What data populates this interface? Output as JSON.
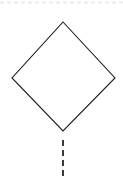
{
  "canvas": {
    "width": 123,
    "height": 179,
    "background_color": "#ffffff"
  },
  "diagram": {
    "type": "flowchart-fragment",
    "title": "",
    "shapes": [
      {
        "id": "decision-diamond",
        "kind": "diamond",
        "label": "",
        "fill_color": "#ffffff",
        "stroke_color": "#1a1a1a",
        "stroke_width": 1,
        "vertices": {
          "top": {
            "x": 63,
            "y": 22
          },
          "right": {
            "x": 115,
            "y": 78
          },
          "bottom": {
            "x": 63,
            "y": 131
          },
          "left": {
            "x": 12,
            "y": 78
          }
        },
        "bounds": {
          "x": 12,
          "y": 22,
          "width": 103,
          "height": 109
        }
      }
    ],
    "connectors": [
      {
        "id": "bottom-dashed-connector",
        "kind": "line",
        "label": "",
        "orientation": "vertical",
        "stroke_color": "#3a3a3a",
        "stroke_width": 2,
        "dash_pattern": "6 4",
        "from": {
          "x": 63,
          "y": 140
        },
        "to": {
          "x": 63,
          "y": 179
        }
      }
    ],
    "guides": [
      {
        "id": "top-guide-line",
        "kind": "line",
        "label": "",
        "orientation": "horizontal",
        "stroke_color": "#ebebeb",
        "stroke_width": 2,
        "dash_pattern": "4 3",
        "from": {
          "x": 0,
          "y": 2
        },
        "to": {
          "x": 123,
          "y": 2
        }
      }
    ]
  }
}
